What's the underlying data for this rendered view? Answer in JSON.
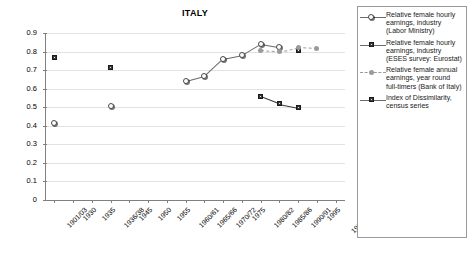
{
  "chart_data": {
    "type": "scatter",
    "title": "ITALY",
    "xlabel": "",
    "ylabel": "",
    "ylim": [
      0,
      0.9
    ],
    "ytick_step": 0.1,
    "grid": true,
    "legend_position": "right",
    "ytick_labels": [
      "0.9",
      "0.8",
      "0.7",
      "0.6",
      "0.5",
      "0.4",
      "0.3",
      "0.2",
      "0.1",
      "0"
    ],
    "categories": [
      "1901/03",
      "1930",
      "1935",
      "1936/38",
      "1945",
      "1950",
      "1955",
      "1960/61",
      "1965/66",
      "1970/72",
      "1975",
      "1980/82",
      "1985/86",
      "1990/91",
      "1995",
      "1998/2000"
    ],
    "series": [
      {
        "name": "Relative female hourly earnings, industry (Labor Ministry)",
        "marker": "open-circle",
        "line": "solid",
        "color": "#6a6a6a",
        "points": [
          {
            "x": "1901/03",
            "y": 0.415,
            "connected": false
          },
          {
            "x": "1936/38",
            "y": 0.508,
            "connected": false
          },
          {
            "x": "1960/61",
            "y": 0.64,
            "connected": true
          },
          {
            "x": "1965/66",
            "y": 0.667,
            "connected": true
          },
          {
            "x": "1970/72",
            "y": 0.762,
            "connected": true
          },
          {
            "x": "1975",
            "y": 0.782,
            "connected": true
          },
          {
            "x": "1980/82",
            "y": 0.843,
            "connected": true
          },
          {
            "x": "1985/86",
            "y": 0.825,
            "connected": true
          }
        ]
      },
      {
        "name": "Relative female hourly earnings, industry (ESES survey: Eurostat)",
        "marker": "filled-square",
        "line": "solid",
        "color": "#3a3a3a",
        "points": [
          {
            "x": "1901/03",
            "y": 0.767,
            "connected": false
          },
          {
            "x": "1936/38",
            "y": 0.715,
            "connected": false
          },
          {
            "x": "1990/91",
            "y": 0.805,
            "connected": false
          }
        ]
      },
      {
        "name": "Relative female annual earnings, year round full-timers (Bank of Italy)",
        "marker": "gray-dot",
        "line": "dashed",
        "color": "#9a9a9a",
        "points": [
          {
            "x": "1980/82",
            "y": 0.808,
            "connected": true
          },
          {
            "x": "1985/86",
            "y": 0.8,
            "connected": true
          },
          {
            "x": "1990/91",
            "y": 0.823,
            "connected": true
          },
          {
            "x": "1995",
            "y": 0.818,
            "connected": true
          }
        ]
      },
      {
        "name": "Index of Dissimilarity, census series",
        "marker": "filled-square",
        "line": "solid",
        "color": "#3a3a3a",
        "points": [
          {
            "x": "1980/82",
            "y": 0.558,
            "connected": true
          },
          {
            "x": "1985/86",
            "y": 0.518,
            "connected": true
          },
          {
            "x": "1990/91",
            "y": 0.498,
            "connected": true
          }
        ]
      }
    ]
  },
  "legend": {
    "entries": [
      {
        "label": "Relative female hourly earnings, industry (Labor Ministry)",
        "key": "open-circle-solid"
      },
      {
        "label": "Relative female hourly earnings, industry (ESES survey: Eurostat)",
        "key": "square-solid"
      },
      {
        "label": "Relative female annual earnings, year round full-timers (Bank of Italy)",
        "key": "dot-dashed"
      },
      {
        "label": "Index of Dissimilarity, census series",
        "key": "square-solid"
      }
    ]
  }
}
